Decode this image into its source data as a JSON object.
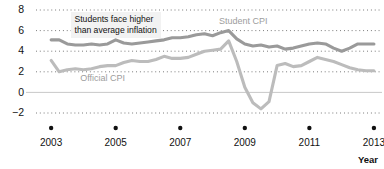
{
  "chart_data": {
    "type": "line",
    "title": "",
    "xlabel": "Year",
    "ylabel": "",
    "ylim": [
      -2,
      8
    ],
    "xlim": [
      2002.5,
      2013.25
    ],
    "yticks": [
      8,
      6,
      4,
      2,
      0,
      -2
    ],
    "xticks": [
      2003,
      2005,
      2007,
      2009,
      2011,
      2013
    ],
    "grid": "horizontal dotted gridlines at 2,4,6,8; solid line at 0",
    "legend": "inline series labels",
    "annotations": [
      {
        "text_line1": "Students face higher",
        "text_line2": "than average inflation",
        "x": 2003.6,
        "y": 7.2
      }
    ],
    "series": [
      {
        "name": "Student CPI",
        "color": "#9a9a9a",
        "label_x": 2008.2,
        "label_y": 6.6,
        "x": [
          2003.0,
          2003.25,
          2003.5,
          2003.75,
          2004.0,
          2004.25,
          2004.5,
          2004.75,
          2005.0,
          2005.25,
          2005.5,
          2005.75,
          2006.0,
          2006.25,
          2006.5,
          2006.75,
          2007.0,
          2007.25,
          2007.5,
          2007.75,
          2008.0,
          2008.25,
          2008.5,
          2008.75,
          2009.0,
          2009.25,
          2009.5,
          2009.75,
          2010.0,
          2010.25,
          2010.5,
          2010.75,
          2011.0,
          2011.25,
          2011.5,
          2011.75,
          2012.0,
          2012.25,
          2012.5,
          2012.75,
          2013.0
        ],
        "y": [
          5.1,
          5.1,
          4.7,
          4.6,
          4.6,
          4.7,
          4.6,
          4.7,
          5.1,
          4.8,
          4.7,
          4.8,
          4.9,
          5.0,
          5.1,
          5.3,
          5.3,
          5.4,
          5.6,
          5.7,
          5.5,
          5.8,
          6.0,
          5.2,
          4.7,
          4.5,
          4.6,
          4.4,
          4.5,
          4.2,
          4.3,
          4.5,
          4.7,
          4.8,
          4.7,
          4.3,
          4.0,
          4.3,
          4.7,
          4.7,
          4.7
        ]
      },
      {
        "name": "Official CPI",
        "color": "#bcbcbc",
        "label_x": 2003.9,
        "label_y": 1.1,
        "x": [
          2003.0,
          2003.25,
          2003.5,
          2003.75,
          2004.0,
          2004.25,
          2004.5,
          2004.75,
          2005.0,
          2005.25,
          2005.5,
          2005.75,
          2006.0,
          2006.25,
          2006.5,
          2006.75,
          2007.0,
          2007.25,
          2007.5,
          2007.75,
          2008.0,
          2008.25,
          2008.5,
          2008.75,
          2009.0,
          2009.25,
          2009.5,
          2009.75,
          2010.0,
          2010.25,
          2010.5,
          2010.75,
          2011.0,
          2011.25,
          2011.5,
          2011.75,
          2012.0,
          2012.25,
          2012.5,
          2012.75,
          2013.0
        ],
        "y": [
          3.1,
          2.0,
          2.2,
          2.3,
          2.2,
          2.3,
          2.5,
          2.6,
          2.6,
          2.9,
          3.1,
          3.0,
          3.0,
          3.2,
          3.5,
          3.3,
          3.3,
          3.4,
          3.7,
          4.0,
          4.1,
          4.2,
          5.0,
          3.0,
          0.5,
          -1.0,
          -1.6,
          -0.9,
          2.6,
          2.8,
          2.5,
          2.6,
          3.0,
          3.4,
          3.2,
          3.0,
          2.7,
          2.4,
          2.2,
          2.1,
          2.1
        ]
      }
    ]
  },
  "axis": {
    "ylabels": [
      "8",
      "6",
      "4",
      "2",
      "0",
      "−2"
    ],
    "xlabels": [
      "2003",
      "2005",
      "2007",
      "2009",
      "2011",
      "2013"
    ],
    "xtitle": "Year"
  },
  "labels": {
    "student_cpi": "Student CPI",
    "official_cpi": "Official CPI",
    "annotation_line1": "Students face higher",
    "annotation_line2": "than average inflation"
  }
}
